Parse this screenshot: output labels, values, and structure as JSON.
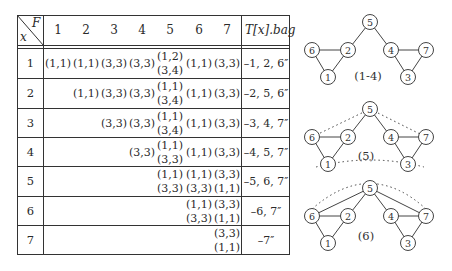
{
  "table": {
    "corner": {
      "top": "F",
      "bottom": "x"
    },
    "columns": [
      "1",
      "2",
      "3",
      "4",
      "5",
      "6",
      "7"
    ],
    "bag_header_prefix": "T[x].bag",
    "rows": [
      {
        "x": "1",
        "cells": [
          [
            "(1,1)"
          ],
          [
            "(1,1)"
          ],
          [
            "(3,3)"
          ],
          [
            "(3,3)"
          ],
          [
            "(1,2)",
            "(3,4)"
          ],
          [
            "(1,1)"
          ],
          [
            "(3,3)"
          ]
        ],
        "bag": "–1, 2, 6″"
      },
      {
        "x": "2",
        "cells": [
          [],
          [
            "(1,1)"
          ],
          [
            "(3,3)"
          ],
          [
            "(3,3)"
          ],
          [
            "(1,1)",
            "(3,4)"
          ],
          [
            "(1,1)"
          ],
          [
            "(3,3)"
          ]
        ],
        "bag": "–2, 5, 6″"
      },
      {
        "x": "3",
        "cells": [
          [],
          [],
          [
            "(3,3)"
          ],
          [
            "(3,3)"
          ],
          [
            "(1,1)",
            "(3,4)"
          ],
          [
            "(1,1)"
          ],
          [
            "(3,3)"
          ]
        ],
        "bag": "–3, 4, 7″"
      },
      {
        "x": "4",
        "cells": [
          [],
          [],
          [],
          [
            "(3,3)"
          ],
          [
            "(1,1)",
            "(3,3)"
          ],
          [
            "(1,1)"
          ],
          [
            "(3,3)"
          ]
        ],
        "bag": "–4, 5, 7″"
      },
      {
        "x": "5",
        "cells": [
          [],
          [],
          [],
          [],
          [
            "(1,1)",
            "(3,3)"
          ],
          [
            "(1,1)",
            "(3,3)"
          ],
          [
            "(3,3)",
            "(1,1)"
          ]
        ],
        "bag": "–5, 6, 7″"
      },
      {
        "x": "6",
        "cells": [
          [],
          [],
          [],
          [],
          [],
          [
            "(1,1)",
            "(3,3)"
          ],
          [
            "(3,3)",
            "(1,1)"
          ]
        ],
        "bag": "–6, 7″"
      },
      {
        "x": "7",
        "cells": [
          [],
          [],
          [],
          [],
          [],
          [],
          [
            "(3,3)",
            "(1,1)"
          ]
        ],
        "bag": "–7″"
      }
    ]
  },
  "graphs": [
    {
      "label": "(1-4)",
      "nodes": [
        "1",
        "2",
        "3",
        "4",
        "5",
        "6",
        "7"
      ],
      "solid_edges": [
        [
          "6",
          "2"
        ],
        [
          "6",
          "1"
        ],
        [
          "2",
          "1"
        ],
        [
          "2",
          "5"
        ],
        [
          "5",
          "4"
        ],
        [
          "4",
          "7"
        ],
        [
          "4",
          "3"
        ],
        [
          "7",
          "3"
        ]
      ],
      "dotted_edges": []
    },
    {
      "label": "(5)",
      "nodes": [
        "1",
        "2",
        "3",
        "4",
        "5",
        "6",
        "7"
      ],
      "solid_edges": [
        [
          "6",
          "2"
        ],
        [
          "6",
          "1"
        ],
        [
          "2",
          "1"
        ],
        [
          "2",
          "5"
        ],
        [
          "5",
          "4"
        ],
        [
          "4",
          "7"
        ],
        [
          "4",
          "3"
        ],
        [
          "7",
          "3"
        ]
      ],
      "dotted_edges": [
        [
          "6",
          "5"
        ],
        [
          "5",
          "7"
        ],
        [
          "6",
          "7"
        ]
      ]
    },
    {
      "label": "(6)",
      "nodes": [
        "1",
        "2",
        "3",
        "4",
        "5",
        "6",
        "7"
      ],
      "solid_edges": [
        [
          "6",
          "2"
        ],
        [
          "6",
          "1"
        ],
        [
          "2",
          "1"
        ],
        [
          "2",
          "5"
        ],
        [
          "5",
          "4"
        ],
        [
          "4",
          "7"
        ],
        [
          "4",
          "3"
        ],
        [
          "7",
          "3"
        ],
        [
          "6",
          "5"
        ],
        [
          "5",
          "7"
        ]
      ],
      "dotted_edges": [
        [
          "6",
          "7"
        ]
      ]
    }
  ]
}
